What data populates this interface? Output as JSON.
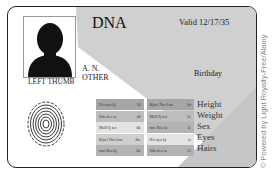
{
  "card": {
    "title": "DNA",
    "valid": "Valid 12/17/35",
    "name_line1": "A. N.",
    "name_line2": "OTHER",
    "thumb_label": "LEFT THUMB",
    "birthday_label": "Birthday",
    "fields": [
      "Height",
      "Weight",
      "Sex",
      "Eyes",
      "Hairs"
    ],
    "table": [
      {
        "left": {
          "text": "Hei qeo kj",
          "code": "18"
        },
        "right": {
          "text": "Kjoel Nio Loo",
          "code": "lxt"
        },
        "shade_left": "#a6a6a6",
        "shade_right": "#a6a6a6"
      },
      {
        "left": {
          "text": "Sda slex se",
          "code": "a8"
        },
        "right": {
          "text": "MoII Ij teo",
          "code": "2e"
        },
        "shade_left": "#bdbdbd",
        "shade_right": "#bdbdbd"
      },
      {
        "left": {
          "text": "MoII Ij teo",
          "code": "0k"
        },
        "right": {
          "text": "mni Bco kj",
          "code": "3e"
        },
        "shade_left": "#e3e3e3",
        "shade_right": "#b3b3b3"
      },
      {
        "left": {
          "text": "Kjoel Nio Loo",
          "code": "8w"
        },
        "right": {
          "text": "Hei qeo kj",
          "code": "vr"
        },
        "shade_left": "#cfcfcf",
        "shade_right": "#e3e3e3"
      },
      {
        "left": {
          "text": "mni Bco kj",
          "code": "kh"
        },
        "right": {
          "text": "Sda slex se",
          "code": "55"
        },
        "shade_left": "#b3b3b3",
        "shade_right": "#b3b3b3"
      }
    ]
  },
  "watermark": "© Powered by Light Royalty-Free/Alamy",
  "colors": {
    "band": "#cfcfcf",
    "border": "#222222"
  }
}
